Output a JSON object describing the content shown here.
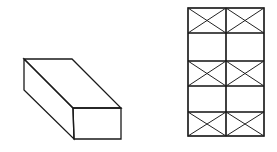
{
  "figure": {
    "stroke_color": "#1a1a1a",
    "background": "#ffffff"
  },
  "box": {
    "label": "",
    "vertices": {
      "back_top_left": [
        24,
        59
      ],
      "back_top_right": [
        72,
        59
      ],
      "front_top_left": [
        73,
        108
      ],
      "front_top_right": [
        121,
        108
      ],
      "front_bottom_left": [
        74,
        139
      ],
      "front_bottom_right": [
        121,
        139
      ],
      "back_bottom_left": [
        24,
        90
      ]
    }
  },
  "grid": {
    "columns": 2,
    "rows": 5,
    "x_lines": [
      188,
      226,
      264
    ],
    "y_lines": [
      8,
      33,
      61,
      86,
      112,
      136
    ],
    "braced_rows": [
      0,
      2,
      4
    ]
  }
}
